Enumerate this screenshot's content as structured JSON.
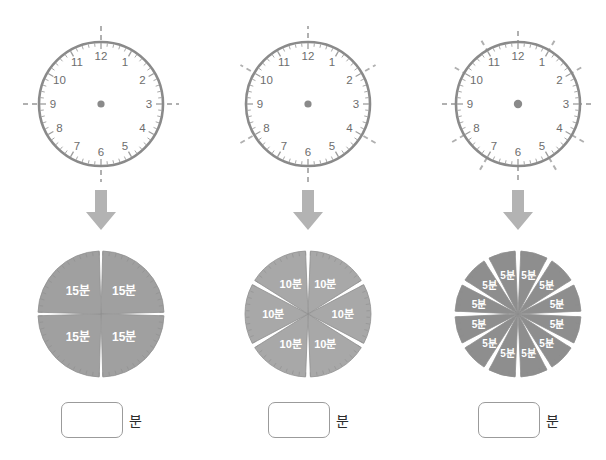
{
  "worksheet": {
    "title": "Clock face division into equal minute parts",
    "background_color": "#ffffff"
  },
  "colors": {
    "clock_rim": "#8a8a8a",
    "clock_tick": "#9d9d9d",
    "clock_numeral": "#6d6d6d",
    "dashed_line": "#b0b0b0",
    "center_dot": "#8a8a8a",
    "arrow": "#b3b3b3",
    "pie_fill_light": "#a8a8a8",
    "pie_fill_mid": "#a0a0a0",
    "pie_fill_dark": "#8e8e8e",
    "pie_stroke": "#8f8f8f",
    "pie_label_text": "#ffffff",
    "box_border": "#9b9b9b",
    "unit_text": "#2b2b2b"
  },
  "clock_numerals": [
    "12",
    "1",
    "2",
    "3",
    "4",
    "5",
    "6",
    "7",
    "8",
    "9",
    "10",
    "11"
  ],
  "columns": [
    {
      "id": "column-1",
      "clock": {
        "name": "clock-quarters",
        "divisions": 4,
        "dash_lines": 2,
        "dash_line_angles_deg": [
          0,
          90
        ],
        "numerals_shown": [
          "12",
          "1",
          "2",
          "3",
          "4",
          "5",
          "6",
          "7",
          "8",
          "9",
          "10",
          "11"
        ],
        "tick_count": 60
      },
      "arrow": {
        "name": "down-arrow",
        "glyph": "down-arrow"
      },
      "pie": {
        "name": "pie-quarters",
        "slices": 4,
        "slice_label": "15분",
        "slice_labels": [
          "15분",
          "15분",
          "15분",
          "15분"
        ],
        "fill": "#a0a0a0"
      },
      "answer": {
        "value": "",
        "placeholder": "",
        "unit": "분"
      }
    },
    {
      "id": "column-2",
      "clock": {
        "name": "clock-sixths",
        "divisions": 6,
        "dash_lines": 3,
        "dash_line_angles_deg": [
          90,
          30,
          150
        ],
        "numerals_shown": [
          "12",
          "1",
          "2",
          "3",
          "4",
          "5",
          "6",
          "7",
          "8",
          "9",
          "10",
          "11"
        ],
        "tick_count": 60
      },
      "arrow": {
        "name": "down-arrow",
        "glyph": "down-arrow"
      },
      "pie": {
        "name": "pie-sixths",
        "slices": 6,
        "slice_label": "10분",
        "slice_labels": [
          "10분",
          "10분",
          "10분",
          "10분",
          "10분",
          "10분"
        ],
        "fill": "#a8a8a8"
      },
      "answer": {
        "value": "",
        "placeholder": "",
        "unit": "분"
      }
    },
    {
      "id": "column-3",
      "clock": {
        "name": "clock-twelfths",
        "divisions": 12,
        "dash_lines": 6,
        "dash_line_angles_deg": [
          90,
          60,
          30,
          0,
          150,
          120
        ],
        "numerals_shown": [
          "12",
          "1",
          "2",
          "3",
          "4",
          "5",
          "6",
          "7",
          "8",
          "9",
          "10",
          "11"
        ],
        "tick_count": 60
      },
      "arrow": {
        "name": "down-arrow",
        "glyph": "down-arrow"
      },
      "pie": {
        "name": "pie-twelfths",
        "slices": 12,
        "slice_label": "5분",
        "slice_labels": [
          "5분",
          "5분",
          "5분",
          "5분",
          "5분",
          "5분",
          "5분",
          "5분",
          "5분",
          "5분",
          "5분",
          "5분"
        ],
        "fill": "#8e8e8e"
      },
      "answer": {
        "value": "",
        "placeholder": "",
        "unit": "분"
      }
    }
  ],
  "chart_data": {
    "type": "pie",
    "charts": [
      {
        "name": "quarters",
        "categories": [
          "15분",
          "15분",
          "15분",
          "15분"
        ],
        "values": [
          15,
          15,
          15,
          15
        ],
        "total": 60,
        "slices": 4
      },
      {
        "name": "sixths",
        "categories": [
          "10분",
          "10분",
          "10분",
          "10분",
          "10분",
          "10분"
        ],
        "values": [
          10,
          10,
          10,
          10,
          10,
          10
        ],
        "total": 60,
        "slices": 6
      },
      {
        "name": "twelfths",
        "categories": [
          "5분",
          "5분",
          "5분",
          "5분",
          "5분",
          "5분",
          "5분",
          "5분",
          "5분",
          "5분",
          "5분",
          "5분"
        ],
        "values": [
          5,
          5,
          5,
          5,
          5,
          5,
          5,
          5,
          5,
          5,
          5,
          5
        ],
        "total": 60,
        "slices": 12
      }
    ],
    "legend": "none",
    "grid": false
  }
}
